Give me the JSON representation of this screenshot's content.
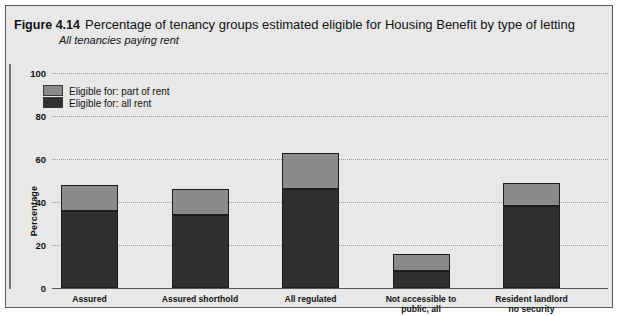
{
  "figure": {
    "number": "Figure 4.14",
    "title": "Percentage of tenancy groups estimated eligible for Housing Benefit by type of letting",
    "subtitle": "All tenancies paying rent"
  },
  "legend": {
    "items": [
      {
        "label": "Eligible for: part of rent",
        "color": "#8b8b8b",
        "key": "part_of_rent"
      },
      {
        "label": "Eligible for: all rent",
        "color": "#303030",
        "key": "all_rent"
      }
    ]
  },
  "axis": {
    "y_label": "Percentage",
    "y_ticks": [
      "100",
      "80",
      "60",
      "40",
      "20",
      "0"
    ]
  },
  "chart_data": {
    "type": "bar",
    "stacked": true,
    "title": "Percentage of tenancy groups estimated eligible for Housing Benefit by type of letting",
    "subtitle": "All tenancies paying rent",
    "xlabel": "",
    "ylabel": "Percentage",
    "ylim": [
      0,
      100
    ],
    "yticks": [
      0,
      20,
      40,
      60,
      80,
      100
    ],
    "grid": true,
    "legend_position": "top-left",
    "categories": [
      "Assured",
      "Assured shorthold",
      "All regulated",
      "Not accessible to\npublic, all",
      "Resident landlord\nno security"
    ],
    "category_lines": [
      [
        "Assured"
      ],
      [
        "Assured shorthold"
      ],
      [
        "All regulated"
      ],
      [
        "Not accessible to",
        "public, all"
      ],
      [
        "Resident landlord",
        "no security"
      ]
    ],
    "series": [
      {
        "name": "Eligible for: all rent",
        "color": "#303030",
        "values": [
          36,
          34,
          46,
          8,
          38
        ]
      },
      {
        "name": "Eligible for: part of rent",
        "color": "#8b8b8b",
        "values": [
          12,
          12,
          17,
          8,
          11
        ]
      }
    ],
    "totals": [
      48,
      46,
      63,
      16,
      49
    ]
  }
}
